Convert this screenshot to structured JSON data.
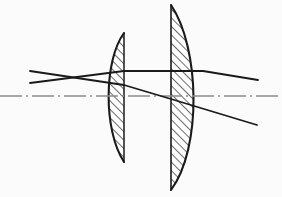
{
  "figure": {
    "type": "optical-ray-diagram",
    "width": 282,
    "height": 197,
    "background_color": "#fbfbfb",
    "stroke_color": "#1a1a1a",
    "hatch_color": "#3a3a3a",
    "axis_color": "#8c8c8c"
  },
  "optical_axis": {
    "label": "optical-axis",
    "style": "dash-dot",
    "color": "#8c8c8c",
    "y": 96,
    "x_start": 0,
    "x_end": 282,
    "dash_pattern": "22 4 2 4"
  },
  "elements": [
    {
      "name": "lens-1",
      "label": "Left plano-convex lens",
      "shape": "plano-convex",
      "flat_side": "right",
      "curved_side": "left",
      "flat_x": 124,
      "top_y": 33,
      "bottom_y": 162,
      "apex_x": 103,
      "hatched": true,
      "hatch_angle_deg": 45
    },
    {
      "name": "lens-2",
      "label": "Right plano-convex lens",
      "shape": "plano-convex",
      "flat_side": "left",
      "curved_side": "right",
      "flat_x": 171,
      "top_y": 5,
      "bottom_y": 190,
      "apex_x": 203,
      "hatched": true,
      "hatch_angle_deg": 45
    }
  ],
  "rays": [
    {
      "name": "ray-upper-incoming",
      "label": "Upper incoming ray (descending)",
      "points": [
        [
          30,
          71
        ],
        [
          124,
          85
        ],
        [
          171,
          99
        ],
        [
          257,
          125
        ]
      ],
      "stroke_width": 1.8
    },
    {
      "name": "ray-lower-incoming",
      "label": "Lower incoming ray (ascending to horizontal)",
      "points": [
        [
          30,
          83
        ],
        [
          124,
          71
        ],
        [
          203,
          71
        ],
        [
          258,
          80
        ]
      ],
      "stroke_width": 1.8
    }
  ],
  "crossing_point": {
    "name": "ray-crossing",
    "label": "Ray crossover point",
    "x": 62,
    "y": 79
  }
}
